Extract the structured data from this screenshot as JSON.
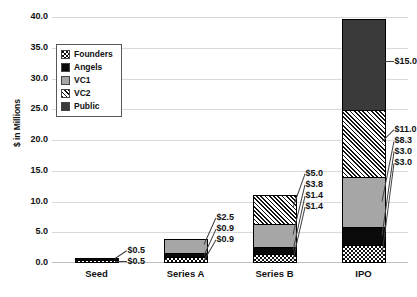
{
  "chart_data": {
    "type": "bar",
    "subtype": "stacked-bar",
    "title": "",
    "xlabel": "",
    "ylabel": "$ in Millions",
    "categories": [
      "Seed",
      "Series A",
      "Series B",
      "IPO"
    ],
    "ylim": [
      0.0,
      40.0
    ],
    "ytick_labels": [
      "40.0",
      "35.0",
      "30.0",
      "25.0",
      "20.0",
      "15.0",
      "10.0",
      "5.0",
      "0.0"
    ],
    "ytick_values": [
      40.0,
      35.0,
      30.0,
      25.0,
      20.0,
      15.0,
      10.0,
      5.0,
      0.0
    ],
    "grid": true,
    "legend_position": "upper-left-inside",
    "series": [
      {
        "name": "Founders",
        "pattern": "dotted",
        "values": [
          0.5,
          0.9,
          1.4,
          3.0
        ]
      },
      {
        "name": "Angels",
        "pattern": "solid-black",
        "values": [
          0.5,
          0.9,
          1.4,
          3.0
        ]
      },
      {
        "name": "VC1",
        "pattern": "solid-gray",
        "values": [
          0.0,
          2.5,
          3.8,
          8.3
        ]
      },
      {
        "name": "VC2",
        "pattern": "diagonal-hatch",
        "values": [
          0.0,
          0.0,
          5.0,
          11.0
        ]
      },
      {
        "name": "Public",
        "pattern": "solid-dark",
        "values": [
          0.0,
          0.0,
          0.0,
          15.0
        ]
      }
    ],
    "data_labels": {
      "Seed": [
        "$0.5",
        "$0.5"
      ],
      "Series A": [
        "$0.9",
        "$0.9",
        "$2.5"
      ],
      "Series B": [
        "$1.4",
        "$1.4",
        "$3.8",
        "$5.0"
      ],
      "IPO": [
        "$3.0",
        "$3.0",
        "$8.3",
        "$11.0",
        "$15.0"
      ]
    }
  },
  "legend": {
    "items": [
      {
        "label": "Founders",
        "swatch": "p-founders"
      },
      {
        "label": "Angels",
        "swatch": "p-angels"
      },
      {
        "label": "VC1",
        "swatch": "p-vc1"
      },
      {
        "label": "VC2",
        "swatch": "p-vc2"
      },
      {
        "label": "Public",
        "swatch": "p-public"
      }
    ]
  }
}
